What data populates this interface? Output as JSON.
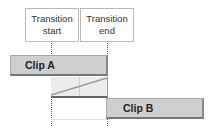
{
  "labels": {
    "transition_start": "Transition start",
    "transition_end": "Transition end"
  },
  "clips": {
    "clip_a": "Clip A",
    "clip_b": "Clip B"
  },
  "colors": {
    "clip_fill": "#cfcfcf",
    "transition_fill": "#ececec",
    "diagonal": "#999999",
    "guide": "#555555"
  }
}
